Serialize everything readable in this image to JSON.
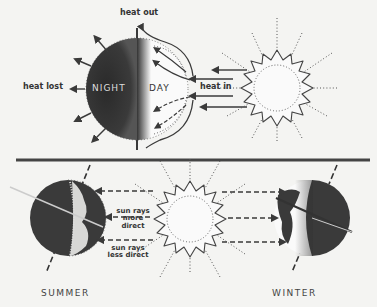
{
  "top": {
    "labels": {
      "heat_out": "heat out",
      "heat_lost": "heat lost",
      "heat_in": "heat in",
      "night": "NIGHT",
      "day": "DAY"
    }
  },
  "bottom": {
    "labels": {
      "rays_more_line1": "sun rays",
      "rays_more_line2": "more",
      "rays_more_line3": "direct",
      "rays_less_line1": "sun rays",
      "rays_less_line2": "less direct"
    },
    "seasons": {
      "summer": "SUMMER",
      "winter": "WINTER"
    }
  },
  "colors": {
    "ink": "#3a3a3a",
    "dark": "#2e2e2e",
    "paper": "#f4f4f2"
  }
}
